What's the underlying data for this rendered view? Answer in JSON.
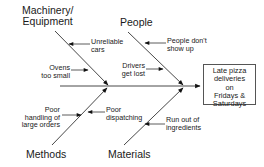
{
  "diagram": {
    "type": "fishbone",
    "effect": "Late pizza deliveries on Fridays & Saturdays",
    "effect_lines": [
      "Late pizza",
      "deliveries",
      "on",
      "Fridays &",
      "Saturdays"
    ],
    "categories": {
      "machinery": {
        "label_lines": [
          "Machinery/",
          "Equipment"
        ],
        "causes": {
          "c1": [
            "Unreliable",
            "cars"
          ],
          "c2": [
            "Ovens",
            "too small"
          ]
        }
      },
      "people": {
        "label": "People",
        "causes": {
          "c1": [
            "People don't",
            "show up"
          ],
          "c2": [
            "Drivers",
            "get lost"
          ]
        }
      },
      "methods": {
        "label": "Methods",
        "causes": {
          "c1": [
            "Poor",
            "handling of",
            "large orders"
          ]
        }
      },
      "materials": {
        "label": "Materials",
        "causes": {
          "c1": [
            "Poor",
            "dispatching"
          ],
          "c2": [
            "Run out of",
            "ingredients"
          ]
        }
      }
    },
    "colors": {
      "line": "#333333",
      "text": "#1a1a1a"
    }
  }
}
